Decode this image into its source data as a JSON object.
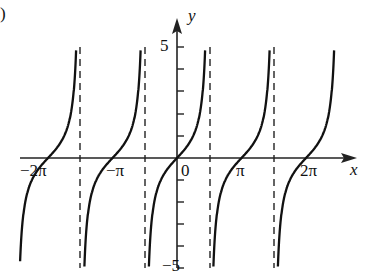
{
  "panel_label": ")",
  "chart_data": {
    "type": "line",
    "title": "",
    "function": "tan(x/2)-like periodic curve with period 2π, zeros at multiples of π shifted",
    "xlabel": "x",
    "ylabel": "y",
    "x_ticks": [
      "−2π",
      "−π",
      "0",
      "π",
      "2π"
    ],
    "y_ticks": [
      "5",
      "−5"
    ],
    "ylim": [
      -5,
      5
    ],
    "xlim": [
      -6.8,
      7.2
    ],
    "zeros": [
      "−2π",
      "−π",
      "0",
      "π",
      "2π"
    ],
    "asymptotes": [
      "−3π/2",
      "−π/2",
      "π/2",
      "3π/2"
    ],
    "grid": false,
    "series": [
      {
        "name": "y = tan x",
        "period": "π",
        "style": "solid"
      }
    ]
  },
  "labels": {
    "x_axis": "x",
    "y_axis": "y",
    "neg2pi": "−2π",
    "negpi": "−π",
    "zero": "0",
    "pi": "π",
    "twopi": "2π",
    "y5": "5",
    "yneg5": "−5"
  }
}
